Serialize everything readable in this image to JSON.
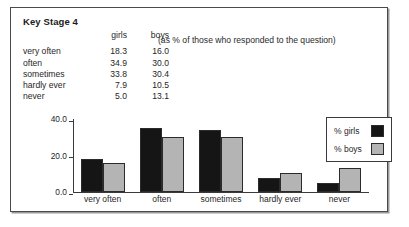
{
  "report": {
    "title": "Key Stage 4",
    "subtitle": "(as % of those who responded to the question)"
  },
  "table": {
    "headers": {
      "category": "",
      "girls": "girls",
      "boys": "boys"
    },
    "rows": [
      {
        "label": "very often",
        "girls": "18.3",
        "boys": "16.0"
      },
      {
        "label": "often",
        "girls": "34.9",
        "boys": "30.0"
      },
      {
        "label": "sometimes",
        "girls": "33.8",
        "boys": "30.4"
      },
      {
        "label": "hardly ever",
        "girls": "7.9",
        "boys": "10.5"
      },
      {
        "label": "never",
        "girls": "5.0",
        "boys": "13.1"
      }
    ]
  },
  "legend": {
    "items": [
      {
        "label": "% girls",
        "color": "#151515"
      },
      {
        "label": "% boys",
        "color": "#b4b4b4"
      }
    ]
  },
  "axis": {
    "yticks": [
      "40.0",
      "20.0",
      "0.0"
    ]
  },
  "chart_data": {
    "type": "bar",
    "title": "Key Stage 4",
    "subtitle": "(as % of those who responded to the question)",
    "categories": [
      "very often",
      "often",
      "sometimes",
      "hardly ever",
      "never"
    ],
    "series": [
      {
        "name": "% girls",
        "values": [
          18.3,
          34.9,
          33.8,
          7.9,
          5.0
        ],
        "color": "#151515"
      },
      {
        "name": "% boys",
        "values": [
          16.0,
          30.0,
          30.4,
          10.5,
          13.1
        ],
        "color": "#b4b4b4"
      }
    ],
    "xlabel": "",
    "ylabel": "",
    "ylim": [
      0,
      40
    ],
    "yticks": [
      0.0,
      20.0,
      40.0
    ],
    "grid": false,
    "legend_position": "top-right"
  }
}
